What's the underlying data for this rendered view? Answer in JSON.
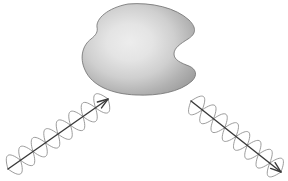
{
  "figure": {
    "background_color": "#ffffff",
    "width": 288,
    "height": 181,
    "caption_fragment": ""
  },
  "scatterer": {
    "label": "scattering-particle",
    "description": "Irregular rounded blob with a concave notch on the right side, shaded with a radial gradient",
    "fill_center_color": "#ededed",
    "fill_edge_color": "#9a9a9a",
    "outline_color": "#6e6e6e",
    "outline_width": 0.8,
    "highlight_center": {
      "x": 131,
      "y": 44
    },
    "bounds": {
      "x": 84,
      "y": 4,
      "width": 113,
      "height": 91
    }
  },
  "waves": [
    {
      "name": "incident-wave",
      "direction": "up-right",
      "arrow_color": "#3a3a3a",
      "helix_color": "#8e8e8e",
      "arrow_width": 1.4,
      "helix_width": 0.8,
      "start": {
        "x": 8,
        "y": 169
      },
      "end": {
        "x": 108,
        "y": 99
      },
      "loops": 4,
      "amplitude": 15,
      "arrowhead_length": 11,
      "arrowhead_spread": 19
    },
    {
      "name": "scattered-wave",
      "direction": "down-right",
      "arrow_color": "#3a3a3a",
      "helix_color": "#8e8e8e",
      "arrow_width": 1.4,
      "helix_width": 0.8,
      "start": {
        "x": 191,
        "y": 101
      },
      "end": {
        "x": 281,
        "y": 172
      },
      "loops": 4,
      "amplitude": 15,
      "arrowhead_length": 11,
      "arrowhead_spread": 19
    }
  ]
}
